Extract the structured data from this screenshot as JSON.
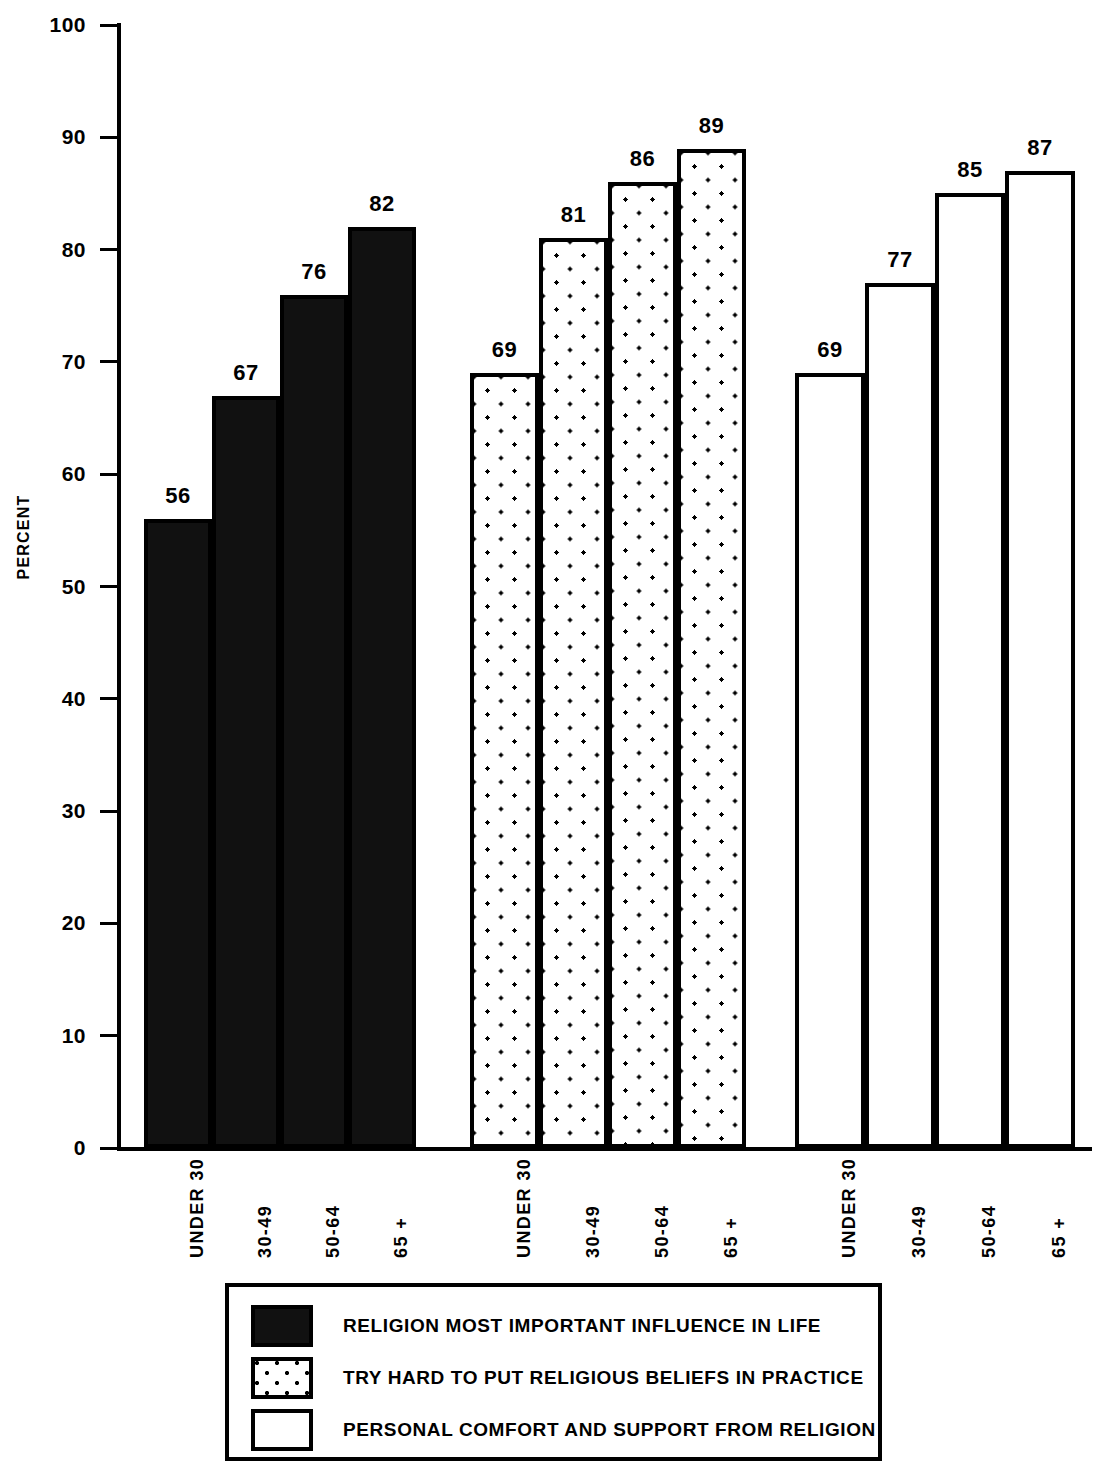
{
  "chart_data": {
    "type": "bar",
    "title": "",
    "xlabel": "",
    "ylabel": "PERCENT",
    "ylim": [
      0,
      100
    ],
    "yticks": [
      0,
      10,
      20,
      30,
      40,
      50,
      60,
      70,
      80,
      90,
      100
    ],
    "grid": false,
    "legend_position": "bottom",
    "categories": [
      "UNDER 30",
      "30-49",
      "50-64",
      "65 +"
    ],
    "series": [
      {
        "name": "RELIGION MOST IMPORTANT INFLUENCE IN LIFE",
        "pattern": "crosshatch",
        "values": [
          56,
          67,
          76,
          82
        ]
      },
      {
        "name": "TRY HARD TO PUT RELIGIOUS BELIEFS IN PRACTICE",
        "pattern": "dots",
        "values": [
          69,
          81,
          86,
          89
        ]
      },
      {
        "name": "PERSONAL COMFORT AND SUPPORT FROM RELIGION",
        "pattern": "plain",
        "values": [
          69,
          77,
          85,
          87
        ]
      }
    ]
  },
  "colors": {
    "ink": "#000000",
    "paper": "#ffffff"
  }
}
